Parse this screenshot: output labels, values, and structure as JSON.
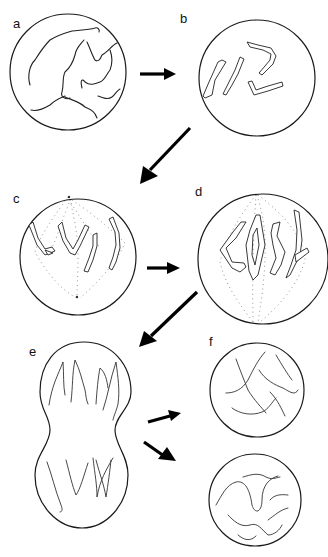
{
  "figure": {
    "panels": [
      {
        "label": "a",
        "stage": "interphase / early prophase",
        "description": "Diffuse thread-like chromatin in nucleus"
      },
      {
        "label": "b",
        "stage": "prophase",
        "description": "Condensed chromosomes, each with two chromatids"
      },
      {
        "label": "c",
        "stage": "prometaphase",
        "description": "Spindle forming, chromosomes attaching"
      },
      {
        "label": "d",
        "stage": "metaphase",
        "description": "Chromosomes aligned at spindle equator"
      },
      {
        "label": "e",
        "stage": "anaphase / telophase",
        "description": "Chromatids separated to opposite poles; cell constricting"
      },
      {
        "label": "f",
        "stage": "daughter cells",
        "description": "Two daughter nuclei with decondensed chromatin"
      }
    ],
    "arrows": [
      {
        "from": "a",
        "to": "b",
        "direction": "right"
      },
      {
        "from": "b",
        "to": "c",
        "direction": "down-left"
      },
      {
        "from": "c",
        "to": "d",
        "direction": "right"
      },
      {
        "from": "d",
        "to": "e",
        "direction": "down-left"
      },
      {
        "from": "e",
        "to": "f-top",
        "direction": "right-up"
      },
      {
        "from": "e",
        "to": "f-bottom",
        "direction": "right-down"
      }
    ]
  },
  "colors": {
    "line": "#1a1a1a",
    "spindle": "#888888",
    "background": "#ffffff"
  }
}
